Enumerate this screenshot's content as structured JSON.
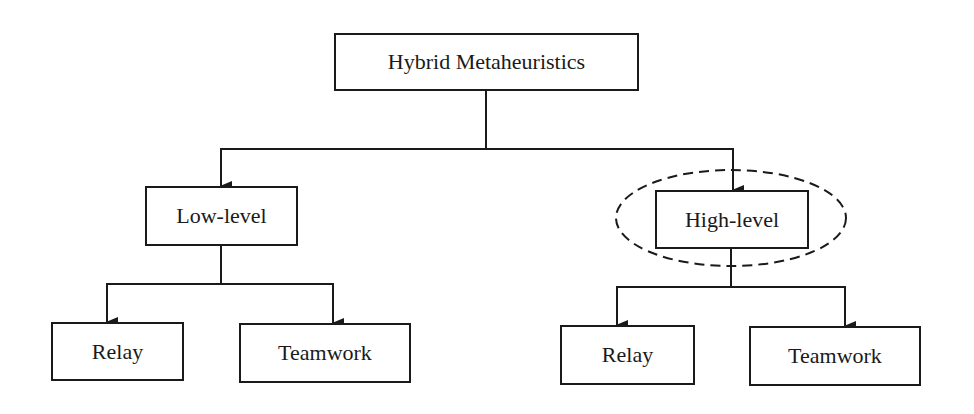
{
  "diagram": {
    "root": {
      "label": "Hybrid Metaheuristics"
    },
    "branches": [
      {
        "label": "Low-level",
        "highlighted": false,
        "children": [
          {
            "label": "Relay"
          },
          {
            "label": "Teamwork"
          }
        ]
      },
      {
        "label": "High-level",
        "highlighted": true,
        "children": [
          {
            "label": "Relay"
          },
          {
            "label": "Teamwork"
          }
        ]
      }
    ],
    "colors": {
      "line": "#1a1a1a",
      "background": "#ffffff"
    }
  }
}
